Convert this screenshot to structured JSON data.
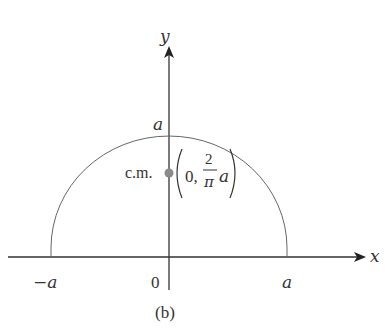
{
  "figure": {
    "caption": "(b)"
  },
  "axes": {
    "x_label": "x",
    "y_label": "y",
    "x_ticks": [
      "−a",
      "0",
      "a"
    ],
    "y_tick": "a"
  },
  "shape": {
    "type": "semicircle",
    "radius_label": "a"
  },
  "center_of_mass": {
    "label": "c.m.",
    "coord_open": "(0,",
    "fraction_num": "2",
    "fraction_den": "π",
    "fraction_var": "a",
    "coord_close": ")",
    "dot_color": "#8a8a8a"
  },
  "colors": {
    "line": "#333333",
    "arc": "#666666"
  }
}
